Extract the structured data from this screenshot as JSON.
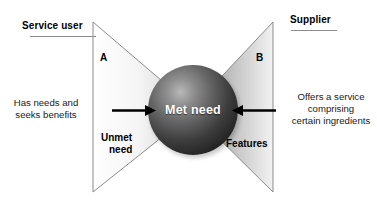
{
  "diagram": {
    "title_left": "Service user",
    "title_right": "Supplier",
    "letter_left": "A",
    "letter_right": "B",
    "left_copy_line1": "Has needs and",
    "left_copy_line2": "seeks benefits",
    "right_copy_line1": "Offers a service",
    "right_copy_line2": "comprising",
    "right_copy_line3": "certain ingredients",
    "wedge_left_line1": "Unmet",
    "wedge_left_line2": "need",
    "wedge_right_label": "Features",
    "center_label": "Met need",
    "icons": {
      "arrow_left_to_center": "arrow-right-icon",
      "arrow_right_to_center": "arrow-left-icon",
      "wedge_left": "triangle-right-icon",
      "wedge_right": "triangle-left-icon",
      "center": "sphere-icon"
    },
    "colors": {
      "background": "#ffffff",
      "text": "#000000",
      "rule": "#8d8d8d",
      "wedge_left_light": "#ffffff",
      "wedge_left_dark": "#c9c9c9",
      "wedge_right_light": "#f2f2f2",
      "wedge_right_dark": "#8f8f8f",
      "sphere_highlight": "#b9b9b9",
      "sphere_shadow": "#161616",
      "sphere_text": "#ffffff",
      "arrow": "#000000",
      "outline": "#7a7a7a"
    }
  }
}
